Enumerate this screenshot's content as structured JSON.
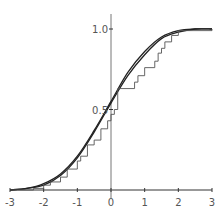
{
  "chart_data": {
    "type": "line",
    "title": "",
    "xlabel": "",
    "ylabel": "",
    "xlim": [
      -3,
      3
    ],
    "ylim": [
      0,
      1.0
    ],
    "grid": false,
    "legend": null,
    "x_ticks": [
      "-3",
      "-2",
      "-1",
      "0",
      "1",
      "2",
      "3"
    ],
    "y_ticks": [
      "0.5",
      "1.0"
    ],
    "series": [
      {
        "name": "smooth CDF 1",
        "style": "smooth",
        "x": [
          -3,
          -2.5,
          -2,
          -1.5,
          -1,
          -0.5,
          0,
          0.5,
          1,
          1.5,
          2,
          2.5,
          3
        ],
        "values": [
          0.0,
          0.01,
          0.04,
          0.1,
          0.21,
          0.37,
          0.55,
          0.73,
          0.86,
          0.95,
          0.99,
          1.0,
          1.0
        ]
      },
      {
        "name": "smooth CDF 2",
        "style": "smooth",
        "x": [
          -3,
          -2.5,
          -2,
          -1.5,
          -1,
          -0.5,
          0,
          0.5,
          1,
          1.5,
          2,
          2.5,
          3
        ],
        "values": [
          0.0,
          0.01,
          0.03,
          0.09,
          0.2,
          0.36,
          0.54,
          0.71,
          0.84,
          0.94,
          0.98,
          1.0,
          1.0
        ]
      },
      {
        "name": "empirical CDF (step)",
        "style": "step",
        "x": [
          -3,
          -2.3,
          -2.0,
          -1.8,
          -1.5,
          -1.3,
          -1.0,
          -0.9,
          -0.7,
          -0.5,
          -0.3,
          -0.1,
          0.0,
          0.1,
          0.2,
          0.7,
          0.8,
          1.0,
          1.3,
          1.4,
          1.5,
          1.6,
          1.8,
          2.0,
          3.0
        ],
        "values": [
          0.0,
          0.01,
          0.03,
          0.05,
          0.08,
          0.13,
          0.18,
          0.21,
          0.28,
          0.31,
          0.38,
          0.43,
          0.47,
          0.5,
          0.63,
          0.67,
          0.71,
          0.76,
          0.8,
          0.85,
          0.88,
          0.92,
          0.96,
          0.99,
          1.0
        ]
      }
    ]
  },
  "axes": {
    "x_ticks": [
      "-3",
      "-2",
      "-1",
      "0",
      "1",
      "2",
      "3"
    ],
    "y_ticks": [
      "0.5",
      "1.0"
    ]
  }
}
